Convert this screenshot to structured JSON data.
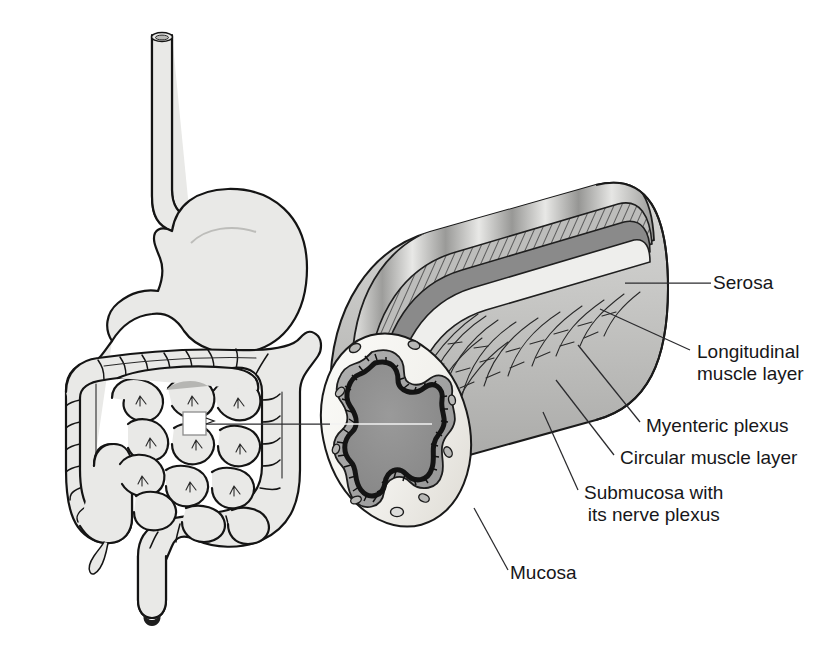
{
  "figure": {
    "kind": "anatomical-illustration",
    "background_color": "#ffffff",
    "ink_color": "#1a1a1a",
    "label_color": "#17171a"
  },
  "overview": {
    "name": "digestive-tract-overview",
    "parts": [
      "esophagus",
      "stomach",
      "small-intestine",
      "large-intestine",
      "cecum",
      "appendix",
      "rectum"
    ],
    "callout_box": {
      "name": "magnification-callout-box",
      "x": 183,
      "y": 412,
      "size": 23
    }
  },
  "cross_section": {
    "name": "intestinal-wall-cross-section",
    "layers": [
      "serosa",
      "longitudinal-muscle-layer",
      "myenteric-plexus",
      "circular-muscle-layer",
      "submucosa-with-nerve-plexus",
      "mucosa"
    ]
  },
  "labels": [
    {
      "id": "serosa",
      "lines": [
        "Serosa"
      ],
      "align": "left",
      "x": 713,
      "y": 272,
      "leader": "M 625 283 L 711 283"
    },
    {
      "id": "longitudinal-muscle-layer",
      "lines": [
        "Longitudinal",
        "muscle layer"
      ],
      "align": "left",
      "x": 697,
      "y": 341,
      "leader": "M 600 309 L 690 350"
    },
    {
      "id": "myenteric-plexus",
      "lines": [
        "Myenteric plexus"
      ],
      "align": "left",
      "x": 646,
      "y": 415,
      "leader": "M 578 345 L 640 422"
    },
    {
      "id": "circular-muscle-layer",
      "lines": [
        "Circular muscle layer"
      ],
      "align": "left",
      "x": 620,
      "y": 447,
      "leader": "M 556 380 L 614 455"
    },
    {
      "id": "submucosa-with-its-nerve-plexus",
      "lines": [
        "Submucosa with",
        "its nerve plexus"
      ],
      "align": "center",
      "x": 584,
      "y": 482,
      "leader": "M 543 412 L 578 490"
    },
    {
      "id": "mucosa",
      "lines": [
        "Mucosa"
      ],
      "align": "left",
      "x": 510,
      "y": 562,
      "leader": "M 474 508 L 508 570"
    }
  ],
  "lumen_leader": {
    "name": "magnification-leader-line",
    "path": "M 206 424 L 430 424"
  },
  "palette": {
    "organ_fill": "#e9e9e7",
    "serosa": "#c9c9c9",
    "longitudinal_muscle_light": "#e3e3e3",
    "longitudinal_muscle_dark": "#9b9b9b",
    "myenteric_band": "#b5b5b5",
    "circular_muscle": "#8a8a8a",
    "submucosa": "#ececea",
    "mucosa_band": "#a3a3a3",
    "lumen": "#8e8e8e",
    "cut_face": "#f4f3ef"
  }
}
